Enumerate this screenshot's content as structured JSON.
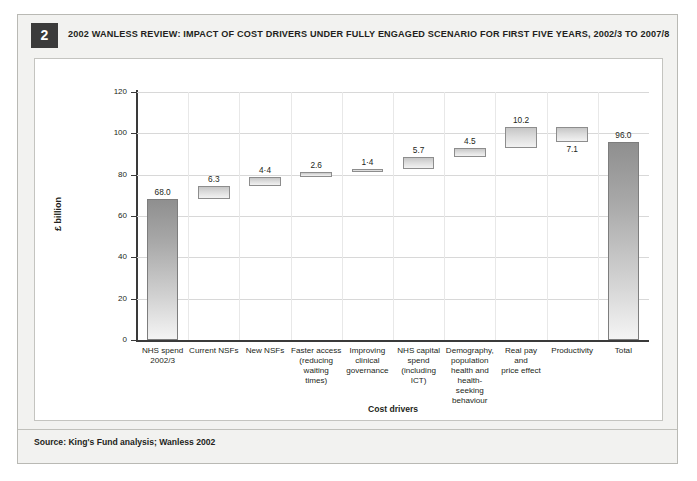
{
  "figure": {
    "number": "2",
    "title": "2002 WANLESS REVIEW: IMPACT OF COST DRIVERS UNDER FULLY ENGAGED SCENARIO FOR FIRST FIVE YEARS, 2002/3 TO 2007/8",
    "source": "Source: King's Fund analysis; Wanless 2002"
  },
  "colors": {
    "badge_background": "#3b3b3b",
    "badge_text": "#ffffff",
    "card_background": "#f2f2f0",
    "panel_background": "#ffffff",
    "bar_fill_light": "#f0f0f0",
    "bar_fill_dark": "#bdbdbd",
    "bar_border": "#8d8d8d",
    "total_bar_dark": "#8f8f8f",
    "gridline": "#d8d8d8",
    "axis": "#3a3a3a",
    "text": "#231f20"
  },
  "chart_data": {
    "type": "bar",
    "subtype": "waterfall",
    "title": "2002 WANLESS REVIEW: IMPACT OF COST DRIVERS UNDER FULLY ENGAGED SCENARIO FOR FIRST FIVE YEARS, 2002/3 TO 2007/8",
    "xlabel": "Cost drivers",
    "ylabel": "£ billion",
    "ylim": [
      0,
      120
    ],
    "yticks": [
      0,
      20,
      40,
      60,
      80,
      100,
      120
    ],
    "ytick_labels": [
      "0",
      "20",
      "40",
      "60",
      "80",
      "100",
      "120"
    ],
    "grid": true,
    "legend": false,
    "categories": [
      "NHS spend 2002/3",
      "Current NSFs",
      "New NSFs",
      "Faster access (reducing waiting times)",
      "Improving clinical governance",
      "NHS capital spend (including ICT)",
      "Demography, population health and health-seeking behaviour",
      "Real pay and price effect",
      "Productivity",
      "Total"
    ],
    "category_lines": [
      [
        "NHS spend",
        "2002/3"
      ],
      [
        "Current NSFs"
      ],
      [
        "New NSFs"
      ],
      [
        "Faster access",
        "(reducing",
        "waiting",
        "times)"
      ],
      [
        "Improving",
        "clinical",
        "governance"
      ],
      [
        "NHS capital",
        "spend",
        "(including",
        "ICT)"
      ],
      [
        "Demography,",
        "population",
        "health and",
        "health-",
        "seeking",
        "behaviour"
      ],
      [
        "Real pay",
        "and",
        "price effect"
      ],
      [
        "Productivity"
      ],
      [
        "Total"
      ]
    ],
    "data_labels": [
      "68.0",
      "6.3",
      "4·4",
      "2.6",
      "1·4",
      "5.7",
      "4.5",
      "10.2",
      "7.1",
      "96.0"
    ],
    "values": [
      68.0,
      6.3,
      4.4,
      2.6,
      1.4,
      5.7,
      4.5,
      10.2,
      -7.1,
      96.0
    ],
    "bar_kinds": [
      "total",
      "increment",
      "increment",
      "increment",
      "increment",
      "increment",
      "increment",
      "increment",
      "decrement",
      "total"
    ],
    "bar_base": [
      0,
      68.0,
      74.3,
      78.7,
      81.3,
      82.7,
      88.4,
      92.9,
      96.0,
      0
    ],
    "bar_top": [
      68.0,
      74.3,
      78.7,
      81.3,
      82.7,
      88.4,
      92.9,
      103.1,
      103.1,
      96.0
    ],
    "cumulative": [
      68.0,
      74.3,
      78.7,
      81.3,
      82.7,
      88.4,
      92.9,
      103.1,
      96.0,
      96.0
    ],
    "label_position": [
      "above",
      "above",
      "above",
      "above",
      "above",
      "above",
      "above",
      "above",
      "below",
      "above"
    ]
  }
}
